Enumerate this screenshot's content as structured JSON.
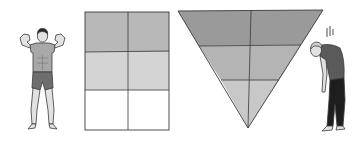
{
  "figure": {
    "colors": {
      "background": "#ffffff",
      "outline": "#3a3a3a",
      "band_dark": "#9a9a9a",
      "band_mid": "#b4b4b4",
      "band_light": "#c8c8c8",
      "grid_dark": "#b8b8b8",
      "grid_mid": "#d4d4d4",
      "grid_light": "#ffffff",
      "skin": "#e2e2e2",
      "shirt": "#a8a8a8",
      "shorts": "#6e6e6e",
      "pants": "#1e1e1e"
    },
    "grid": {
      "rows": 3,
      "cols": 2,
      "row_shades": [
        "dark",
        "mid",
        "light"
      ]
    },
    "triangle": {
      "bands": 3,
      "band_shades": [
        "dark",
        "mid",
        "light"
      ],
      "orientation": "inverted"
    },
    "left_person": {
      "label": "strong-man",
      "pose": "flexing biceps"
    },
    "right_person": {
      "label": "tired-man",
      "pose": "slumped head down",
      "motion_marks": 3
    }
  }
}
